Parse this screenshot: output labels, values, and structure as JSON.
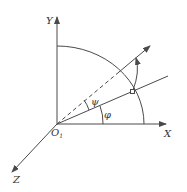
{
  "diagram": {
    "type": "coordinate-system",
    "axes": {
      "x": {
        "label": "X"
      },
      "y": {
        "label": "Y"
      },
      "z": {
        "label": "Z"
      }
    },
    "origin": {
      "label": "O",
      "subscript": "1"
    },
    "angles": {
      "phi": {
        "label": "φ",
        "from": "X axis",
        "to": "inclined line"
      },
      "psi": {
        "label": "ψ",
        "from": "inclined line",
        "to": "rotated arrow line"
      }
    },
    "elements": [
      "quarter-circle arc centered at origin",
      "inclined line at angle φ",
      "dashed/solid rotated line at angle φ+ψ with arrow",
      "small circle marker at arc–line intersection",
      "curved rotation arrow"
    ],
    "colors": {
      "stroke": "#4a4a4a",
      "text": "#333333",
      "background": "#ffffff"
    }
  }
}
